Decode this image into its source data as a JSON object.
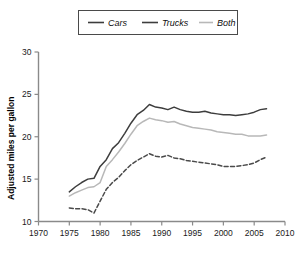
{
  "chart_data": {
    "type": "line",
    "title": "",
    "xlabel": "",
    "ylabel": "Adjusted miles per gallon",
    "xlim": [
      1970,
      2010
    ],
    "ylim": [
      10,
      30
    ],
    "xticks": [
      1970,
      1975,
      1980,
      1985,
      1990,
      1995,
      2000,
      2005,
      2010
    ],
    "yticks": [
      10,
      15,
      20,
      25,
      30
    ],
    "grid": false,
    "legend_position": "top-center",
    "legend": [
      "Cars",
      "Trucks",
      "Both"
    ],
    "x": [
      1975,
      1976,
      1977,
      1978,
      1979,
      1980,
      1981,
      1982,
      1983,
      1984,
      1985,
      1986,
      1987,
      1988,
      1989,
      1990,
      1991,
      1992,
      1993,
      1994,
      1995,
      1996,
      1997,
      1998,
      1999,
      2000,
      2001,
      2002,
      2003,
      2004,
      2005,
      2006,
      2007
    ],
    "series": [
      {
        "name": "Cars",
        "style": "solid",
        "color": "#3d3d3d",
        "values": [
          13.5,
          14.1,
          14.6,
          15.0,
          15.1,
          16.5,
          17.3,
          18.6,
          19.3,
          20.4,
          21.6,
          22.6,
          23.1,
          23.8,
          23.5,
          23.4,
          23.2,
          23.5,
          23.2,
          23.0,
          22.9,
          22.9,
          23.0,
          22.8,
          22.7,
          22.6,
          22.6,
          22.5,
          22.6,
          22.7,
          22.9,
          23.2,
          23.3
        ]
      },
      {
        "name": "Trucks",
        "style": "dashed",
        "color": "#4a4a4a",
        "values": [
          11.6,
          11.5,
          11.5,
          11.4,
          11.0,
          12.4,
          13.8,
          14.6,
          15.2,
          16.0,
          16.7,
          17.2,
          17.6,
          18.0,
          17.7,
          17.6,
          17.8,
          17.5,
          17.4,
          17.2,
          17.1,
          17.0,
          16.9,
          16.8,
          16.7,
          16.5,
          16.5,
          16.5,
          16.6,
          16.7,
          16.9,
          17.3,
          17.6
        ]
      },
      {
        "name": "Both",
        "style": "solid",
        "color": "#b8b8b8",
        "values": [
          13.0,
          13.4,
          13.7,
          14.0,
          14.1,
          14.6,
          16.5,
          17.3,
          18.2,
          19.2,
          20.3,
          21.3,
          21.8,
          22.2,
          22.0,
          21.9,
          21.7,
          21.8,
          21.5,
          21.3,
          21.1,
          21.0,
          20.9,
          20.8,
          20.6,
          20.5,
          20.4,
          20.3,
          20.3,
          20.1,
          20.1,
          20.1,
          20.2
        ]
      }
    ]
  }
}
